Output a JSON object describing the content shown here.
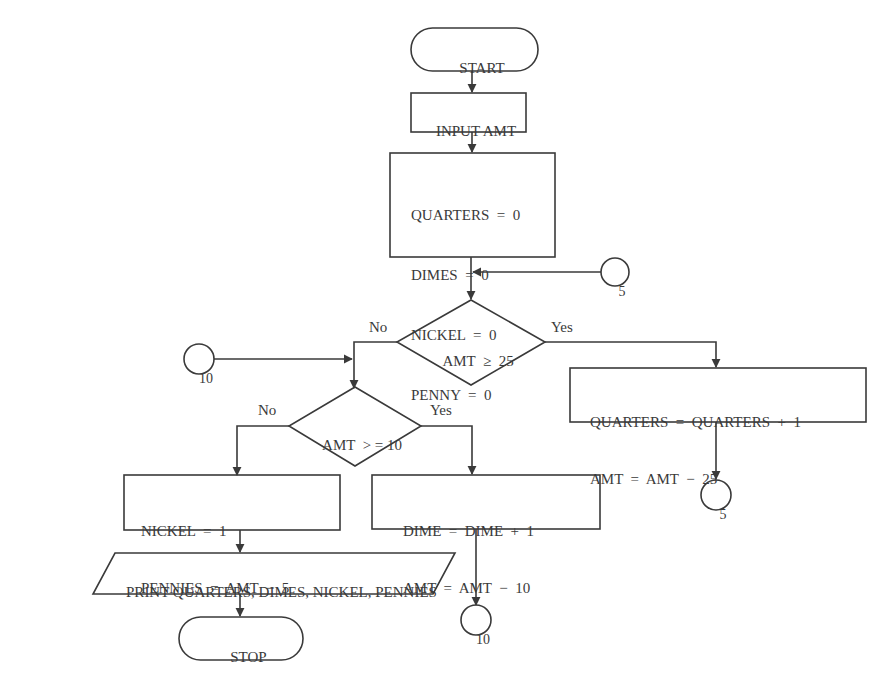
{
  "diagram": {
    "type": "flowchart",
    "stroke_color": "#3a3a3a",
    "background": "#ffffff",
    "nodes": {
      "start": {
        "shape": "terminal",
        "label": "START"
      },
      "input": {
        "shape": "process",
        "label": "INPUT AMT"
      },
      "init": {
        "shape": "process",
        "lines": [
          "QUARTERS  =  0",
          "DIMES  =  0",
          "NICKEL  =  0",
          "PENNY  =  0"
        ]
      },
      "connector_5_in": {
        "shape": "connector",
        "label": "5"
      },
      "decision_25": {
        "shape": "decision",
        "label": "AMT  ≥  25",
        "no_label": "No",
        "yes_label": "Yes"
      },
      "connector_10_in": {
        "shape": "connector",
        "label": "10"
      },
      "quarters_update": {
        "shape": "process",
        "lines": [
          "QUARTERS  =  QUARTERS  +  1",
          "AMT  =  AMT  −  25"
        ]
      },
      "connector_5_out": {
        "shape": "connector",
        "label": "5"
      },
      "decision_10": {
        "shape": "decision",
        "label": "AMT  > = 10",
        "no_label": "No",
        "yes_label": "Yes"
      },
      "nickel_update": {
        "shape": "process",
        "lines": [
          "NICKEL  =  1",
          "PENNIES  =  AMT  −  5"
        ]
      },
      "dime_update": {
        "shape": "process",
        "lines": [
          "DIME  =  DIME  +  1",
          "AMT  =  AMT  −  10"
        ]
      },
      "connector_10_out": {
        "shape": "connector",
        "label": "10"
      },
      "print": {
        "shape": "io",
        "label": "PRINT QUARTERS, DIMES, NICKEL, PENNIES"
      },
      "stop": {
        "shape": "terminal",
        "label": "STOP"
      }
    }
  }
}
